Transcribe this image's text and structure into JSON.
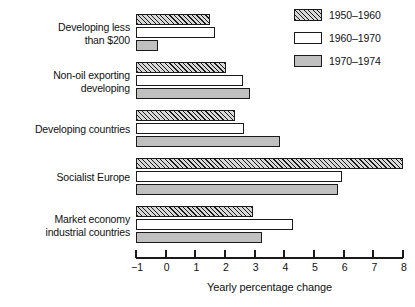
{
  "chart_data": {
    "type": "bar",
    "orientation": "horizontal",
    "title": "",
    "xlabel": "Yearly percentage change",
    "ylabel": "",
    "xlim": [
      -1,
      8
    ],
    "xticks": [
      -1,
      0,
      1,
      2,
      3,
      4,
      5,
      6,
      7,
      8
    ],
    "xtick_labels": [
      "−1",
      "0",
      "1",
      "2",
      "3",
      "4",
      "5",
      "6",
      "7",
      "8"
    ],
    "grid": false,
    "legend_position": "top-right",
    "categories": [
      "Developing less\nthan $200",
      "Non-oil exporting\ndeveloping",
      "Developing countries",
      "Socialist Europe",
      "Market economy\nindustrial countries"
    ],
    "series": [
      {
        "name": "1950–1960",
        "fill": "hatch",
        "values": [
          1.5,
          2.05,
          2.35,
          8.0,
          2.95
        ]
      },
      {
        "name": "1960–1970",
        "fill": "white",
        "values": [
          1.65,
          2.6,
          2.65,
          5.95,
          4.3
        ]
      },
      {
        "name": "1970–1974",
        "fill": "gray",
        "values": [
          -0.25,
          2.85,
          3.85,
          5.8,
          3.25
        ]
      }
    ]
  },
  "legend": {
    "items": [
      {
        "label": "1950–1960",
        "fill": "hatch",
        "color": "#d8d8d8"
      },
      {
        "label": "1960–1970",
        "fill": "white",
        "color": "#ffffff"
      },
      {
        "label": "1970–1974",
        "fill": "gray",
        "color": "#c0c0c0"
      }
    ]
  },
  "axis": {
    "xlabel": "Yearly percentage change",
    "tick_labels": [
      "−1",
      "0",
      "1",
      "2",
      "3",
      "4",
      "5",
      "6",
      "7",
      "8"
    ]
  },
  "colors": {
    "ink": "#1a1a1a",
    "background": "#ffffff",
    "hatch_fill": "#d8d8d8",
    "gray_fill": "#c0c0c0"
  }
}
